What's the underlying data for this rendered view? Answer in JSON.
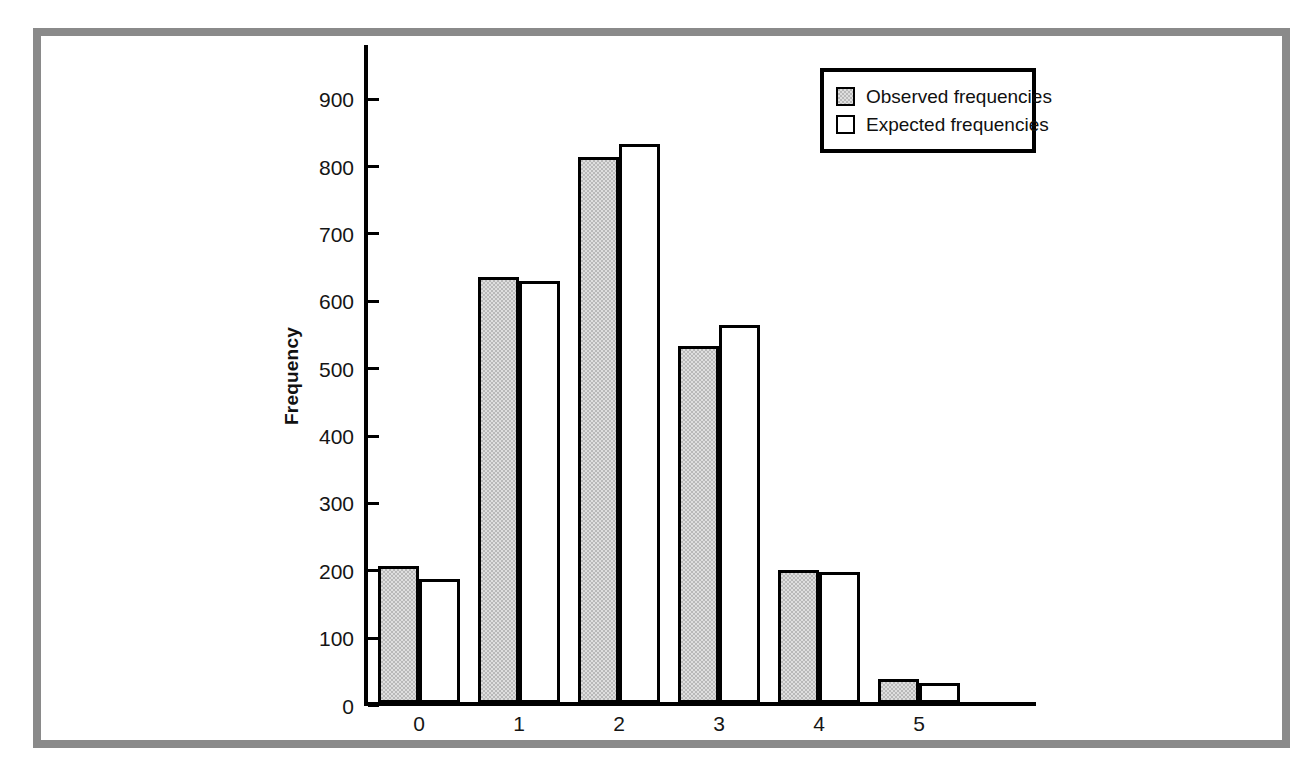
{
  "chart_data": {
    "type": "bar",
    "title": "",
    "subtitle": "",
    "xlabel": "",
    "ylabel": "Frequency",
    "categories": [
      "0",
      "1",
      "2",
      "3",
      "4",
      "5"
    ],
    "series": [
      {
        "name": "Observed frequencies",
        "values": [
          203,
          633,
          810,
          530,
          198,
          35
        ],
        "fill": "#b9b9b9",
        "stroke": "#000000"
      },
      {
        "name": "Expected frequencies",
        "values": [
          184,
          627,
          830,
          561,
          195,
          29
        ],
        "fill": "#ffffff",
        "stroke": "#000000"
      }
    ],
    "ylim": [
      0,
      950
    ],
    "y_ticks": [
      0,
      100,
      200,
      300,
      400,
      500,
      600,
      700,
      800,
      900
    ],
    "y_tick_labels": [
      "0",
      "100",
      "200",
      "300",
      "400",
      "500",
      "600",
      "700",
      "800",
      "900"
    ],
    "x_tick_labels": [
      "0",
      "1",
      "2",
      "3",
      "4",
      "5"
    ],
    "grid": false,
    "legend_position": "top-right",
    "legend_entries": [
      "Observed frequencies",
      "Expected frequencies"
    ]
  },
  "legend": {
    "entries": [
      {
        "label": "Observed frequencies",
        "swatch": "observed-swatch"
      },
      {
        "label": "Expected frequencies",
        "swatch": "expected-swatch"
      }
    ]
  },
  "axes": {
    "y_title": "Frequency"
  },
  "colors": {
    "observed_fill": "#b9b9b9",
    "expected_fill": "#ffffff",
    "axis": "#000000",
    "frame": "#8a8a8a",
    "background": "#ffffff"
  }
}
